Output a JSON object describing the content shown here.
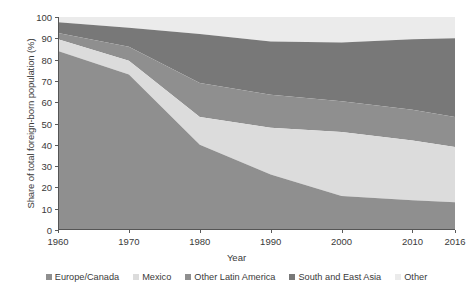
{
  "chart_data": {
    "type": "area",
    "title": "",
    "subtitle": "",
    "xlabel": "Year",
    "ylabel": "Share of total foreign-born population (%)",
    "xlim": [
      1960,
      2016
    ],
    "ylim": [
      0,
      100
    ],
    "grid": false,
    "stacked": true,
    "stack_order": "bottom-to-top",
    "legend_position": "bottom",
    "x": [
      1960,
      1970,
      1980,
      1990,
      2000,
      2010,
      2016
    ],
    "xticks": [
      "1960",
      "1970",
      "1980",
      "1990",
      "2000",
      "2010",
      "2016"
    ],
    "yticks": [
      "0",
      "10",
      "20",
      "30",
      "40",
      "50",
      "60",
      "70",
      "80",
      "90",
      "100"
    ],
    "series": [
      {
        "name": "Europe/Canada",
        "color": "#8f8f8f",
        "values": [
          84,
          73,
          40,
          26,
          16,
          14,
          13
        ]
      },
      {
        "name": "Mexico",
        "color": "#dcdcdc",
        "values": [
          5.5,
          6.5,
          13,
          22,
          30,
          28,
          26
        ]
      },
      {
        "name": "Other Latin America",
        "color": "#8f8f8f",
        "values": [
          3,
          6.5,
          16,
          15.5,
          14.5,
          14.5,
          14
        ]
      },
      {
        "name": "South and East Asia",
        "color": "#787878",
        "values": [
          5,
          9,
          23,
          25,
          27.5,
          33,
          37
        ]
      },
      {
        "name": "Other",
        "color": "#ebebeb",
        "values": [
          2.5,
          5,
          8,
          11.5,
          12,
          10.5,
          10
        ]
      }
    ],
    "cumulative_tops": {
      "Europe/Canada": [
        84,
        73,
        40,
        26,
        16,
        14,
        13
      ],
      "Mexico": [
        89.5,
        79.5,
        53,
        48,
        46,
        42,
        39
      ],
      "Other Latin America": [
        92.5,
        86,
        69,
        63.5,
        60.5,
        56.5,
        53
      ],
      "South and East Asia": [
        97.5,
        95,
        92,
        88.5,
        88,
        89.5,
        90
      ],
      "Other": [
        100,
        100,
        100,
        100,
        100,
        100,
        100
      ]
    }
  },
  "legend": {
    "items": [
      {
        "label": "Europe/Canada",
        "color": "#8f8f8f"
      },
      {
        "label": "Mexico",
        "color": "#dcdcdc"
      },
      {
        "label": "Other Latin America",
        "color": "#8f8f8f"
      },
      {
        "label": "South and East Asia",
        "color": "#787878"
      },
      {
        "label": "Other",
        "color": "#ebebeb"
      }
    ]
  }
}
